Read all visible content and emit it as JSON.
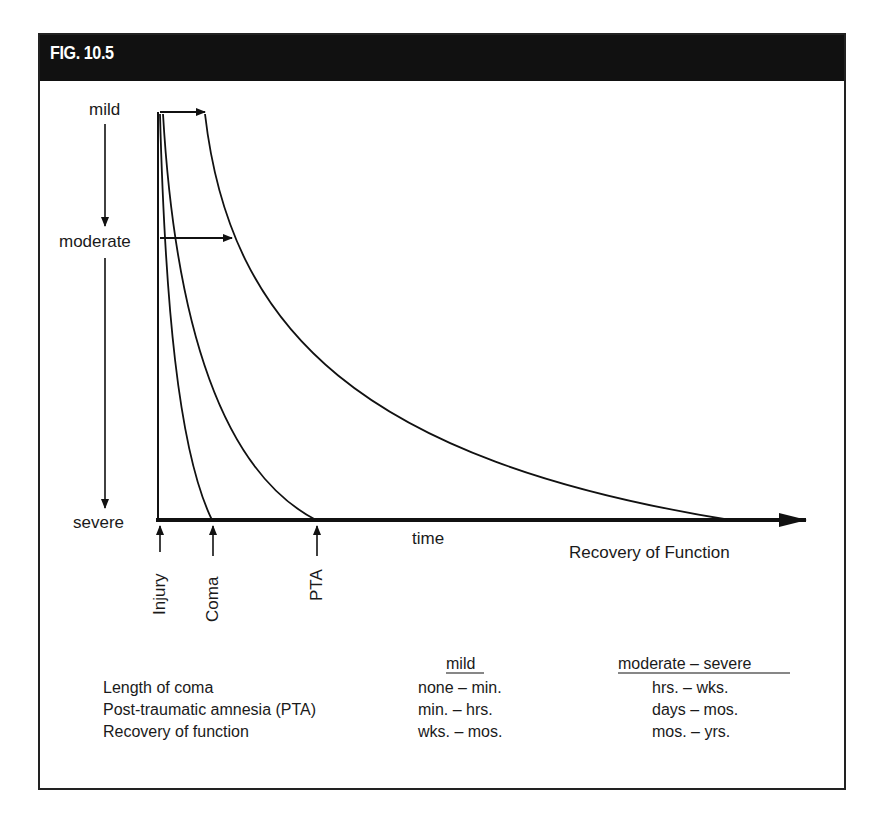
{
  "figure": {
    "title": "FIG. 10.5"
  },
  "diagram": {
    "severity_axis": {
      "labels": [
        "mild",
        "moderate",
        "severe"
      ]
    },
    "time_axis": {
      "label": "time",
      "end_label": "Recovery of Function"
    },
    "markers": [
      "Injury",
      "Coma",
      "PTA"
    ],
    "curves": [
      {
        "name": "coma",
        "description": "Length of coma curve"
      },
      {
        "name": "pta",
        "description": "Post-traumatic amnesia curve"
      },
      {
        "name": "recovery",
        "description": "Recovery of function curve"
      }
    ]
  },
  "table": {
    "headers": [
      "",
      "mild",
      "moderate – severe"
    ],
    "rows": [
      {
        "label": "Length of coma",
        "mild": "none – min.",
        "moderate_severe": "hrs. – wks."
      },
      {
        "label": "Post-traumatic amnesia (PTA)",
        "mild": "min. – hrs.",
        "moderate_severe": "days – mos."
      },
      {
        "label": "Recovery of function",
        "mild": "wks. – mos.",
        "moderate_severe": "mos. – yrs."
      }
    ]
  }
}
